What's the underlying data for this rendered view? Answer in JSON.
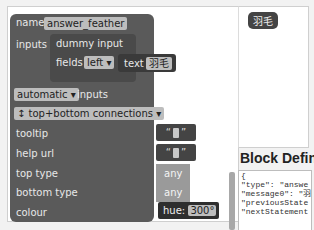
{
  "block": {
    "name_label": "name",
    "name_value": "answer_feather",
    "inputs_label": "inputs",
    "dummy_input_label": "dummy input",
    "fields_label": "fields",
    "fields_align": "left",
    "dropdown_arrow": "▾",
    "text_label": "text",
    "text_value": "羽毛",
    "inputs_mode": "automatic",
    "inputs_mode_suffix": "inputs",
    "connections": "top+bottom connections",
    "connections_icon": "↕",
    "tooltip_label": "tooltip",
    "helpurl_label": "help url",
    "toptype_label": "top type",
    "toptype_value": "any",
    "bottomtype_label": "bottom type",
    "bottomtype_value": "any",
    "colour_label": "colour",
    "hue_label": "hue:",
    "hue_value": "300°",
    "quote_open": "“",
    "quote_close": "”"
  },
  "preview": {
    "chip_text": "羽毛"
  },
  "definition": {
    "title": "Block Defin",
    "code_lines": [
      "{",
      "  \"type\": \"answe",
      "  \"message0\": \"羽",
      "  \"previousState",
      "  \"nextStatement"
    ]
  }
}
